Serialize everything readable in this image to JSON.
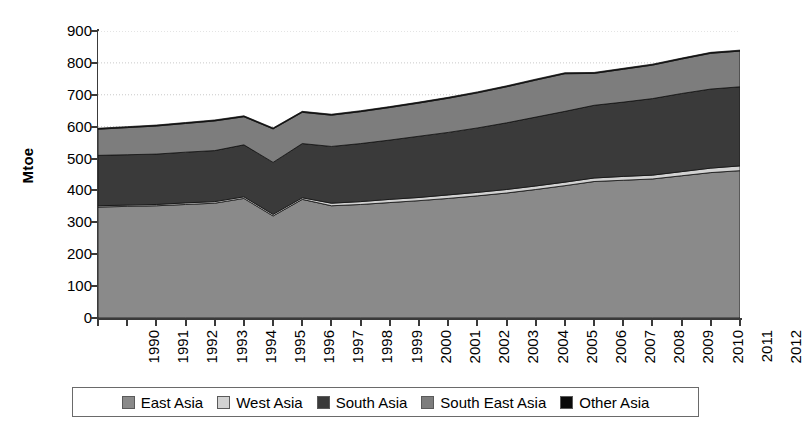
{
  "chart_data": {
    "type": "area",
    "stacked": true,
    "title": "",
    "xlabel": "",
    "ylabel": "Mtoe",
    "ylim": [
      0,
      900
    ],
    "ytick_step": 100,
    "yticks": [
      900,
      800,
      700,
      600,
      500,
      400,
      300,
      200,
      100,
      0
    ],
    "grid": true,
    "grid_axis": "y",
    "legend_position": "bottom",
    "categories": [
      "1990",
      "1991",
      "1992",
      "1993",
      "1994",
      "1995",
      "1996",
      "1997",
      "1998",
      "1999",
      "2000",
      "2001",
      "2002",
      "2003",
      "2004",
      "2005",
      "2006",
      "2007",
      "2008",
      "2009",
      "2010",
      "2011",
      "2012"
    ],
    "series": [
      {
        "name": "East Asia",
        "color": "#8a8a8a",
        "values": [
          348,
          350,
          352,
          356,
          360,
          375,
          320,
          372,
          352,
          356,
          362,
          368,
          375,
          383,
          392,
          403,
          415,
          428,
          432,
          436,
          446,
          456,
          462
        ]
      },
      {
        "name": "West Asia",
        "color": "#d2d2d2",
        "values": [
          4,
          4,
          4,
          5,
          5,
          5,
          5,
          5,
          8,
          9,
          10,
          10,
          11,
          11,
          11,
          11,
          11,
          11,
          12,
          12,
          13,
          14,
          15
        ]
      },
      {
        "name": "South Asia",
        "color": "#3a3a3a",
        "values": [
          158,
          158,
          158,
          159,
          160,
          163,
          163,
          170,
          178,
          182,
          186,
          192,
          196,
          202,
          209,
          216,
          222,
          228,
          233,
          240,
          245,
          248,
          248
        ]
      },
      {
        "name": "South East Asia",
        "color": "#7d7d7d",
        "values": [
          82,
          85,
          88,
          90,
          93,
          88,
          105,
          98,
          98,
          100,
          102,
          104,
          107,
          110,
          113,
          116,
          118,
          100,
          103,
          105,
          108,
          112,
          112
        ]
      },
      {
        "name": "Other Asia",
        "color": "#0a0a0a",
        "values": [
          3,
          3,
          3,
          3,
          3,
          3,
          3,
          3,
          3,
          3,
          3,
          3,
          3,
          3,
          3,
          3,
          3,
          3,
          3,
          3,
          3,
          3,
          3
        ]
      }
    ],
    "totals": [
      595,
      600,
      605,
      613,
      621,
      634,
      596,
      648,
      639,
      650,
      663,
      677,
      692,
      709,
      728,
      749,
      769,
      770,
      783,
      796,
      815,
      833,
      840
    ]
  },
  "legend": {
    "items": [
      {
        "label": "East Asia"
      },
      {
        "label": "West Asia"
      },
      {
        "label": "South Asia"
      },
      {
        "label": "South East Asia"
      },
      {
        "label": "Other Asia"
      }
    ]
  }
}
